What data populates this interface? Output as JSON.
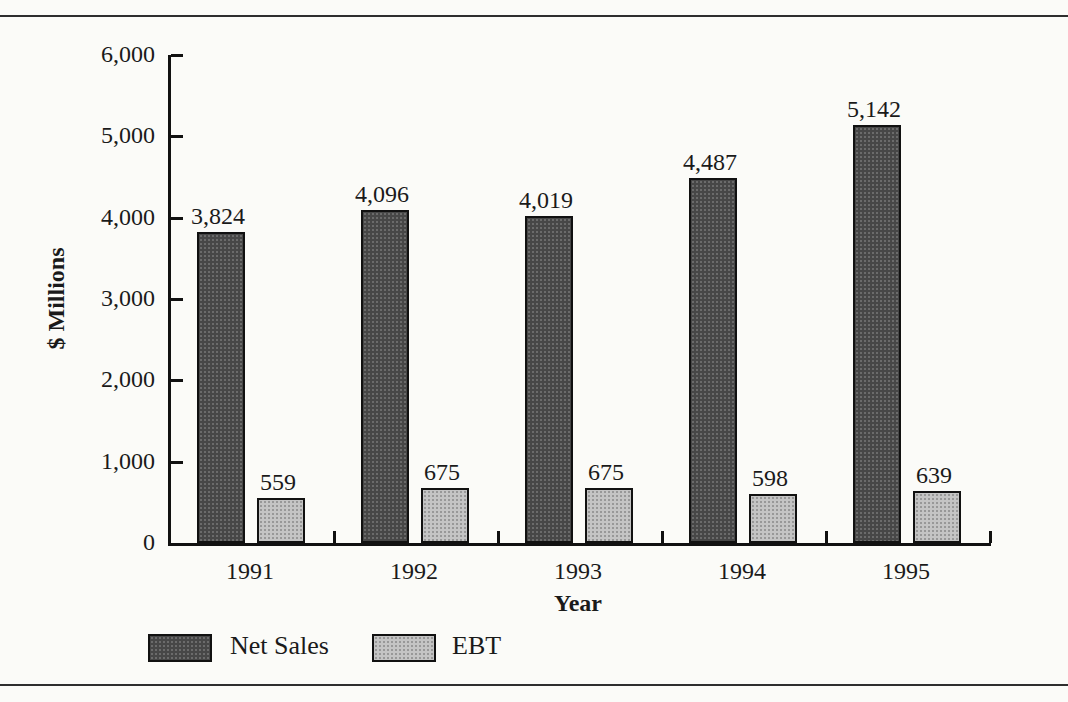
{
  "figure": {
    "background_color": "#fbfbf8",
    "rule_color": "#2e2e2e"
  },
  "chart_data": {
    "type": "bar",
    "title": "",
    "categories": [
      "1991",
      "1992",
      "1993",
      "1994",
      "1995"
    ],
    "series": [
      {
        "name": "Net Sales",
        "values": [
          3824,
          4096,
          4019,
          4487,
          5142
        ],
        "value_labels": [
          "3,824",
          "4,096",
          "4,019",
          "4,487",
          "5,142"
        ],
        "color": "#474747",
        "dot_color": "#6b6b6b"
      },
      {
        "name": "EBT",
        "values": [
          559,
          675,
          675,
          598,
          639
        ],
        "value_labels": [
          "559",
          "675",
          "675",
          "598",
          "639"
        ],
        "color": "#c4c4c4",
        "dot_color": "#989898"
      }
    ],
    "xlabel": "Year",
    "ylabel": "$ Millions",
    "ylim": [
      0,
      6000
    ],
    "ytick_interval": 1000,
    "ytick_labels": [
      "0",
      "1,000",
      "2,000",
      "3,000",
      "4,000",
      "5,000",
      "6,000"
    ],
    "grid": false,
    "legend_position": "below-plot-left"
  }
}
